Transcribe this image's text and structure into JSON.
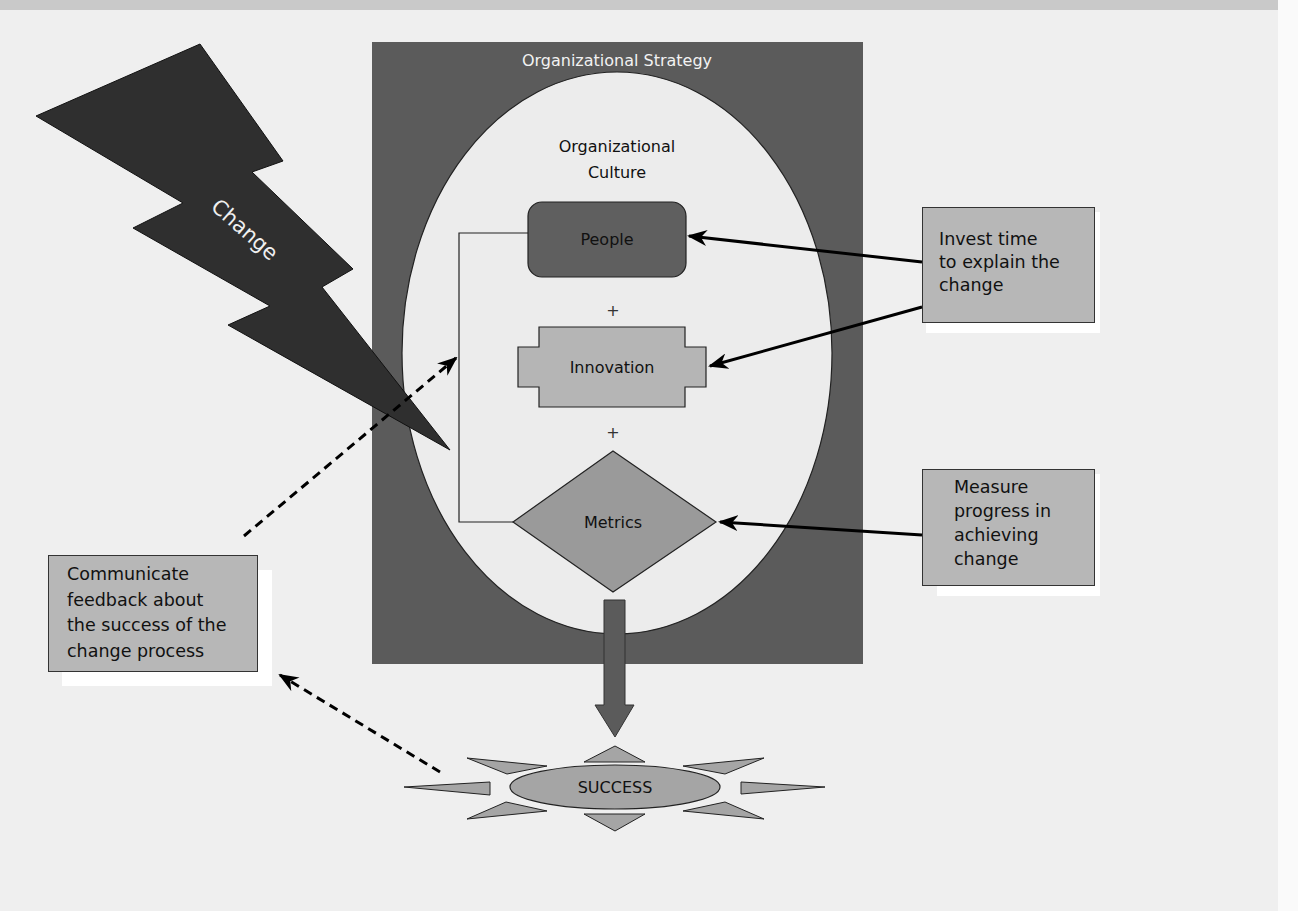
{
  "diagram": {
    "type": "change management model",
    "change": {
      "label": "Change"
    },
    "strategy": {
      "label": "Organizational Strategy"
    },
    "culture": {
      "label_line1": "Organizational",
      "label_line2": "Culture"
    },
    "elements": {
      "people": "People",
      "plus_1": "+",
      "innovation": "Innovation",
      "plus_2": "+",
      "metrics": "Metrics"
    },
    "outcome": {
      "label": "SUCCESS"
    },
    "callouts": {
      "invest": {
        "text": "Invest time\nto explain the\nchange",
        "target": "People, Innovation"
      },
      "measure": {
        "text": "Measure\nprogress in\nachieving\nchange",
        "target": "Metrics"
      },
      "communicate": {
        "text": "Communicate\nfeedback about\nthe success of the\nchange process",
        "source": "SUCCESS",
        "target": "Organizational Culture"
      }
    },
    "colors": {
      "background": "#efefef",
      "strategy_fill": "#5b5b5b",
      "culture_fill": "#ececec",
      "people_fill": "#5f5f5f",
      "innovation_fill": "#b5b5b5",
      "metrics_fill": "#9a9a9a",
      "bolt_fill": "#2f2f2f",
      "callout_fill": "#b7b7b7"
    }
  }
}
